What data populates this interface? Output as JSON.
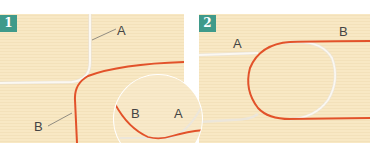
{
  "figure": {
    "steps": [
      {
        "number": "1",
        "labels": {
          "white_cord": "A",
          "orange_cord": "B"
        },
        "inset_labels": {
          "left": "B",
          "right": "A"
        }
      },
      {
        "number": "2",
        "labels": {
          "white_cord": "A",
          "orange_cord": "B"
        }
      }
    ],
    "colors": {
      "background": "#f8e8c4",
      "badge": "#3f9a8a",
      "cord_a": "#f7f4ee",
      "cord_b": "#e2522a",
      "label_text": "#444444"
    }
  }
}
